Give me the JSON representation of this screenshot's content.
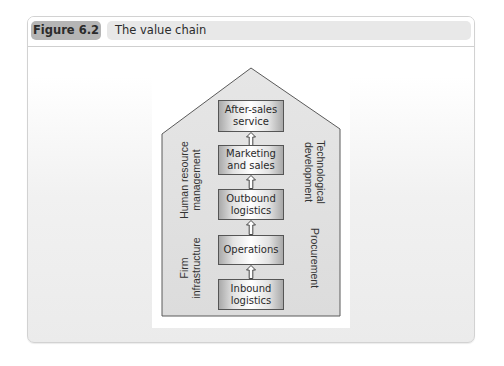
{
  "figure": {
    "number_label": "Figure 6.2",
    "title": "The value chain"
  },
  "diagram": {
    "type": "value-chain-house",
    "primary_activities": [
      {
        "label": "After-sales\nservice"
      },
      {
        "label": "Marketing\nand sales"
      },
      {
        "label": "Outbound\nlogistics"
      },
      {
        "label": "Operations"
      },
      {
        "label": "Inbound\nlogistics"
      }
    ],
    "support_activities_left": [
      {
        "label": "Human resource\nmanagement"
      },
      {
        "label": "Firm\ninfrastructure"
      }
    ],
    "support_activities_right": [
      {
        "label": "Technological\ndevelopment"
      },
      {
        "label": "Procurement"
      }
    ],
    "flow_direction": "upward",
    "colors": {
      "house_fill": "#e4e4e4",
      "house_stroke": "#555555",
      "box_border": "#555555",
      "figure_pill": "#b5b5b5",
      "title_pill": "#e8e8e8"
    }
  }
}
